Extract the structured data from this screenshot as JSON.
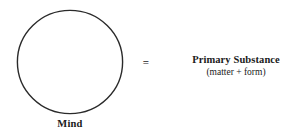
{
  "diagram": {
    "background_color": "#ffffff",
    "stroke_color": "#2a2a2a",
    "text_color": "#1b1b1b",
    "left_node": {
      "shape_icon": "circle-outline-icon",
      "label": "Mind"
    },
    "relation": {
      "symbol": "=",
      "icon": "equals-sign-icon"
    },
    "right_node": {
      "title": "Primary Substance",
      "subtitle": "(matter + form)"
    }
  }
}
